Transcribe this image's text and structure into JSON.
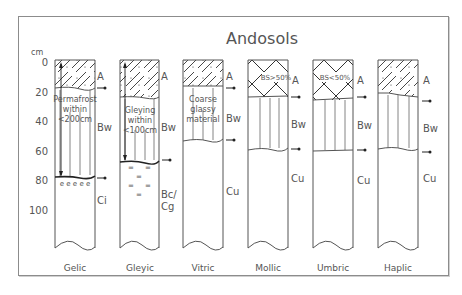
{
  "title": "Andosols",
  "axis": {
    "unit": "cm",
    "ticks": [
      "0",
      "20",
      "40",
      "60",
      "80",
      "100"
    ]
  },
  "profiles": [
    {
      "name": "Gelic",
      "horizons": [
        "A",
        "Bw",
        "Ci"
      ],
      "annotation": [
        "Permafrost",
        "within",
        "<200cm"
      ],
      "pattern_top": "hatch-dots",
      "lower_marks": "e e e e e"
    },
    {
      "name": "Gleyic",
      "horizons": [
        "A",
        "Bw",
        "Bc/",
        "Cg"
      ],
      "annotation": [
        "Gleying",
        "within",
        "<100cm"
      ],
      "pattern_top": "hatch-dots",
      "lower_marks": "="
    },
    {
      "name": "Vitric",
      "horizons": [
        "A",
        "Bw",
        "Cu"
      ],
      "annotation": [
        "Coarse",
        "glassy",
        "material"
      ],
      "pattern_top": "hatch-dots"
    },
    {
      "name": "Mollic",
      "horizons": [
        "A",
        "Bw",
        "Cu"
      ],
      "annotation": [
        "BS>50%"
      ],
      "pattern_top": "crosshatch"
    },
    {
      "name": "Umbric",
      "horizons": [
        "A",
        "Bw",
        "Cu"
      ],
      "annotation": [
        "BS<50%"
      ],
      "pattern_top": "crosshatch"
    },
    {
      "name": "Haplic",
      "horizons": [
        "A",
        "Bw",
        "Cu"
      ],
      "annotation": [],
      "pattern_top": "hatch-dots"
    }
  ],
  "colors": {
    "line": "#555555",
    "text": "#555555",
    "frame": "#8c8c8c"
  }
}
